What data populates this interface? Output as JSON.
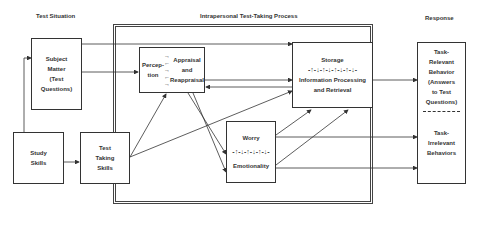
{
  "headers": {
    "test_situation": "Test Situation",
    "process": "Intrapersonal Test-Taking Process",
    "response": "Response"
  },
  "boxes": {
    "subject_matter": [
      "Subject",
      "Matter",
      "(Test",
      "Questions)"
    ],
    "study_skills": [
      "Study",
      "Skills"
    ],
    "test_taking_skills": [
      "Test",
      "Taking",
      "Skills"
    ],
    "perception": [
      "Percep-",
      "tion"
    ],
    "appraisal": [
      "Appraisal",
      "and",
      "Reappraisal"
    ],
    "storage": {
      "title": "Storage",
      "symbols": "-↑-↓-↑-↓-↑-↓-↑-↓-",
      "subtitle": [
        "Information Processing",
        "and Retrieval"
      ]
    },
    "worry": {
      "title": "Worry",
      "symbols": "-↑-↓-↑-↓-↑-↓-",
      "subtitle": "Emotionality"
    },
    "response": {
      "relevant": [
        "Task-",
        "Relevant",
        "Behavior",
        "(Answers",
        "to Test",
        "Questions)"
      ],
      "irrelevant": [
        "Task-",
        "Irrelevant",
        "Behaviors"
      ]
    }
  },
  "colors": {
    "line": "#333333",
    "background": "#ffffff"
  }
}
